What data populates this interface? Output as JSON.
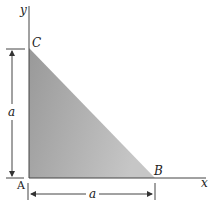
{
  "figure": {
    "axes": {
      "x_label": "x",
      "y_label": "y"
    },
    "vertices": {
      "A": {
        "label": "A",
        "x": 29,
        "y": 178
      },
      "B": {
        "label": "B",
        "x": 155,
        "y": 178
      },
      "C": {
        "label": "C",
        "x": 29,
        "y": 48
      }
    },
    "dimensions": {
      "vertical": {
        "label": "a"
      },
      "horizontal": {
        "label": "a"
      }
    },
    "colors": {
      "fill_dark": "#9a9a9a",
      "fill_light": "#c4c4c4",
      "line": "#333333"
    }
  }
}
